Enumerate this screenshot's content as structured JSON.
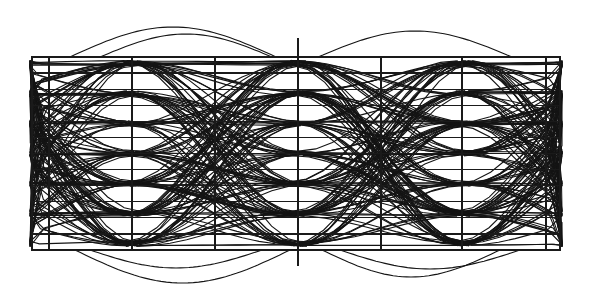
{
  "diagram": {
    "type": "eye-diagram",
    "colors": {
      "background": "#ffffff",
      "trace": "#141414",
      "grid": "#1a1a1a"
    },
    "plot_area": {
      "left": 32,
      "top": 57,
      "right": 560,
      "bottom": 250
    },
    "vertical_gridlines_x": [
      49,
      132,
      215,
      298,
      381,
      462,
      546
    ],
    "horizontal_gridline_count": 12,
    "center_marker": {
      "x": 298,
      "top": 38,
      "bottom": 266
    },
    "signal": {
      "levels": 7,
      "symbol_period_px": 166,
      "eye_crossings_x": [
        49,
        215,
        381,
        547
      ],
      "trace_count": 150,
      "overshoot_arcs": [
        {
          "x0": 70,
          "x1": 276,
          "peak_y": 27,
          "side": "top"
        },
        {
          "x0": 100,
          "x1": 272,
          "peak_y": 34,
          "side": "top"
        },
        {
          "x0": 318,
          "x1": 512,
          "peak_y": 31,
          "side": "top"
        },
        {
          "x0": 75,
          "x1": 290,
          "peak_y": 283,
          "side": "bottom"
        },
        {
          "x0": 90,
          "x1": 262,
          "peak_y": 268,
          "side": "bottom"
        },
        {
          "x0": 322,
          "x1": 500,
          "peak_y": 277,
          "side": "bottom"
        },
        {
          "x0": 340,
          "x1": 520,
          "peak_y": 269,
          "side": "bottom"
        }
      ]
    }
  }
}
